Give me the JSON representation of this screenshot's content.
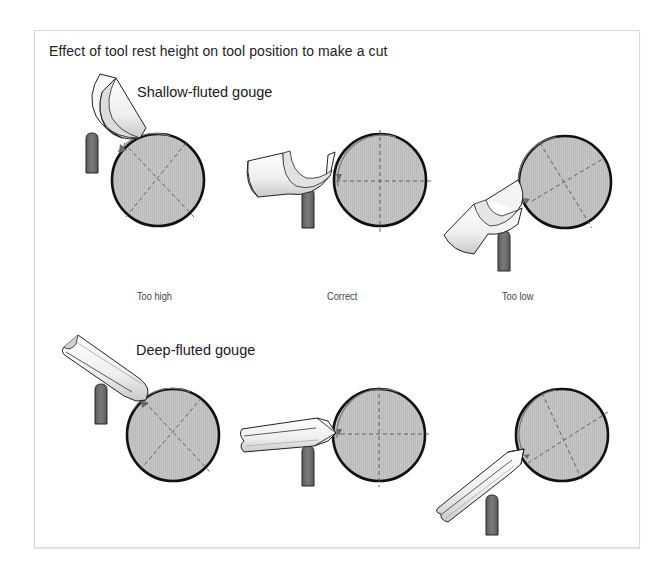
{
  "figure": {
    "title": "Effect of tool rest height on tool position to make a cut",
    "sections": [
      {
        "heading": "Shallow-fluted gouge",
        "panels": [
          {
            "caption": "Too high",
            "tool": "shallow-gouge",
            "rest_position": "high"
          },
          {
            "caption": "Correct",
            "tool": "shallow-gouge",
            "rest_position": "center"
          },
          {
            "caption": "Too low",
            "tool": "shallow-gouge",
            "rest_position": "low"
          }
        ]
      },
      {
        "heading": "Deep-fluted gouge",
        "panels": [
          {
            "caption": "Too high",
            "tool": "deep-gouge",
            "rest_position": "high"
          },
          {
            "caption": "Correct",
            "tool": "deep-gouge",
            "rest_position": "center"
          },
          {
            "caption": "Too low",
            "tool": "deep-gouge",
            "rest_position": "low"
          }
        ]
      }
    ],
    "captions": [
      "Too high",
      "Correct",
      "Too low"
    ],
    "colors": {
      "workpiece_fill": "#c4c4c4",
      "workpiece_outline": "#111111",
      "tool_rest_fill": "#6b6b6b",
      "tool_fill": "#f2f2f2",
      "centerline": "#555555",
      "frame_border": "#d9d9d9"
    }
  }
}
